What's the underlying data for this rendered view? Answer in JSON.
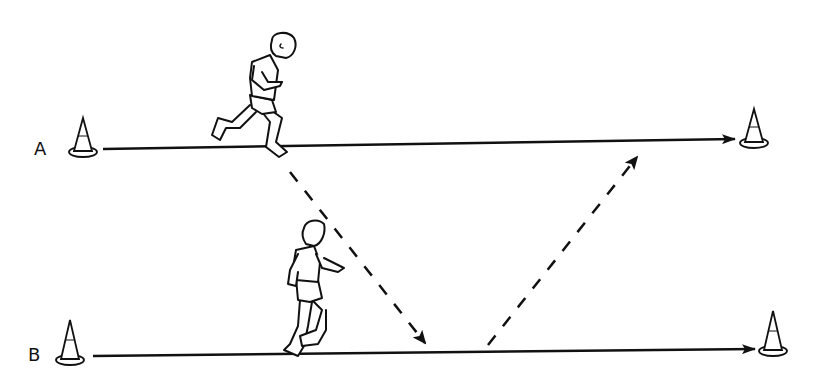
{
  "diagram": {
    "type": "sports-drill",
    "lanes": [
      {
        "label": "A",
        "y": 148,
        "start_x": 103,
        "end_x": 735,
        "direction": "right"
      },
      {
        "label": "B",
        "y": 352,
        "start_x": 93,
        "end_x": 755,
        "direction": "right"
      }
    ],
    "cones": [
      {
        "lane": "A",
        "position": "start",
        "x": 83,
        "y": 152
      },
      {
        "lane": "A",
        "position": "end",
        "x": 754,
        "y": 143
      },
      {
        "lane": "B",
        "position": "start",
        "x": 70,
        "y": 360
      },
      {
        "lane": "B",
        "position": "end",
        "x": 773,
        "y": 351
      }
    ],
    "pass_path": {
      "style": "dashed",
      "segments": [
        {
          "from": [
            290,
            172
          ],
          "to": [
            425,
            343
          ]
        },
        {
          "from": [
            488,
            345
          ],
          "to": [
            637,
            157
          ]
        }
      ]
    },
    "players": [
      {
        "lane": "A",
        "pose": "running",
        "x": 265,
        "y": 85
      },
      {
        "lane": "B",
        "pose": "jogging",
        "x": 310,
        "y": 295
      }
    ],
    "colors": {
      "ink": "#111111",
      "background": "#ffffff"
    }
  },
  "labels": {
    "lane_a": "A",
    "lane_b": "B"
  }
}
